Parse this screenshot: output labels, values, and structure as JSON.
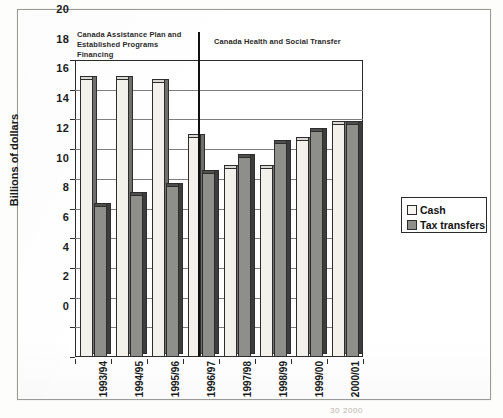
{
  "chart_data": {
    "type": "bar",
    "title": "",
    "subtitle": "",
    "xlabel": "",
    "ylabel": "Billions of dollars",
    "ylim": [
      0,
      20
    ],
    "ytick_step": 2,
    "yticks": [
      "20",
      "18",
      "16",
      "14",
      "12",
      "10",
      "8",
      "6",
      "4",
      "2",
      "0"
    ],
    "grid": true,
    "grid_axis": "y",
    "legend_position": "right",
    "categories": [
      "1993/94",
      "1994/95",
      "1995/96",
      "1996/97",
      "1997/98",
      "1998/99",
      "1999/00",
      "2000/01"
    ],
    "series": [
      {
        "name": "Cash",
        "color": "#f2f1ec",
        "values": [
          18.7,
          18.7,
          18.5,
          14.8,
          12.7,
          12.7,
          14.6,
          15.7
        ]
      },
      {
        "name": "Tax transfers",
        "color": "#8e8e8b",
        "values": [
          10.2,
          10.9,
          11.5,
          12.4,
          13.5,
          14.4,
          15.2,
          15.7
        ]
      }
    ],
    "annotations": [
      {
        "name": "era-left",
        "text": "Canada Assistance Plan and Established Programs Financing",
        "spans_categories": [
          "1993/94",
          "1995/96"
        ]
      },
      {
        "name": "era-right",
        "text": "Canada Health and Social Transfer",
        "spans_categories": [
          "1996/97",
          "2000/01"
        ]
      },
      {
        "name": "era-divider",
        "text": "",
        "at_x": "between 1995/96 and 1996/97"
      }
    ]
  },
  "annotations": {
    "left_era": "Canada Assistance Plan and\nEstablished Programs Financing",
    "left_era_line1": "Canada Assistance Plan and",
    "left_era_line2": "Established Programs Financing",
    "right_era": "Canada Health and Social Transfer"
  },
  "axis": {
    "y_title": "Billions of dollars"
  },
  "legend": {
    "items": [
      {
        "label": "Cash",
        "swatch": "cash"
      },
      {
        "label": "Tax transfers",
        "swatch": "tax"
      }
    ]
  },
  "footer": {
    "source_fragment": "30  2000"
  },
  "colors": {
    "cash_face": "#f2f1ec",
    "cash_side": "#6f6f6c",
    "tax_face": "#8e8e8b",
    "tax_side": "#3d3d3b",
    "axis": "#2b2b2b",
    "grid": "#7e7e7e",
    "page": "#ffffff"
  }
}
